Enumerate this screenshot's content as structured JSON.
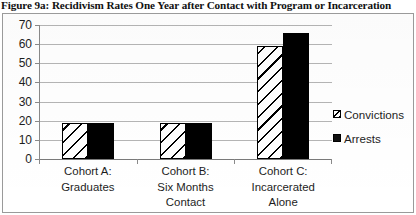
{
  "figure": {
    "title": "Figure 9a: Recidivism Rates One Year after Contact with Program or Incarceration"
  },
  "chart_data": {
    "type": "bar",
    "title": "Figure 9a: Recidivism Rates One Year after Contact with Program or Incarceration",
    "xlabel": "",
    "ylabel": "",
    "ylim": [
      0,
      70
    ],
    "yticks": [
      0,
      10,
      20,
      30,
      40,
      50,
      60,
      70
    ],
    "ytick_labels": [
      "0",
      "10",
      "20",
      "30",
      "40",
      "50",
      "60",
      "70"
    ],
    "grid": true,
    "legend_position": "right",
    "categories": [
      "Cohort A: Graduates",
      "Cohort B: Six Months Contact",
      "Cohort C: Incarcerated Alone"
    ],
    "category_lines": [
      [
        "Cohort A:",
        "Graduates"
      ],
      [
        "Cohort B:",
        "Six Months",
        "Contact"
      ],
      [
        "Cohort C:",
        "Incarcerated",
        "Alone"
      ]
    ],
    "series": [
      {
        "name": "Convictions",
        "pattern": "diagonal-hatch",
        "color": "#000000",
        "values": [
          19,
          19,
          59
        ]
      },
      {
        "name": "Arrests",
        "pattern": "solid",
        "color": "#000000",
        "values": [
          19,
          19,
          66
        ]
      }
    ]
  },
  "legend": {
    "entries": [
      {
        "label": "Convictions"
      },
      {
        "label": "Arrests"
      }
    ]
  }
}
